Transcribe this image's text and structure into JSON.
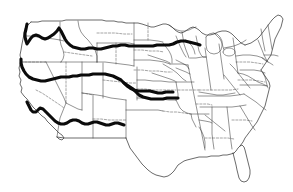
{
  "figure": {
    "background_color": "#ffffff",
    "outline_color": "#2b2b2b",
    "route_color": "#0b0b0b",
    "border_style_note": "thin solid national/coastal outline with thin solid and dashed interior state boundaries",
    "width_px": 293,
    "height_px": 192
  },
  "routes": {
    "count": 3,
    "style": "thick solid black line",
    "items": [
      {
        "id": "northern-route",
        "name": "Northern route",
        "description": "Runs from the Pacific Northwest coast eastward across the northern tier to the western Great Lakes region",
        "start_region": "Pacific Northwest coast",
        "end_region": "Upper Midwest / western Great Lakes"
      },
      {
        "id": "central-route",
        "name": "Central route",
        "description": "Runs from the northern California coast eastward across the central plains, splitting into two branches near the Missouri valley",
        "start_region": "Northern California coast",
        "end_region": "Central plains / Missouri valley",
        "branches": 2
      },
      {
        "id": "southern-route",
        "name": "Southern route",
        "description": "Runs from the southern California coast eastward, ending in the desert Southwest",
        "start_region": "Southern California coast",
        "end_region": "Desert Southwest"
      }
    ]
  },
  "map_regions": {
    "labels": [],
    "note": "No text labels are printed on this map"
  },
  "legend": {
    "present": false,
    "entries": []
  }
}
